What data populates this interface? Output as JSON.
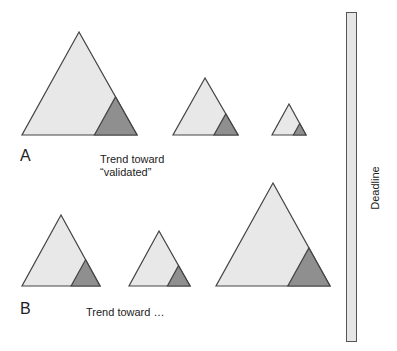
{
  "diagram": {
    "colors": {
      "light_fill": "#e8e8e8",
      "dark_fill": "#8f8f8f",
      "stroke": "#444444",
      "bar_fill": "#e6e6e6"
    },
    "row_a": {
      "label": "A",
      "caption_line1": "Trend toward",
      "caption_line2": "“validated”",
      "triangles": [
        {
          "size": "large",
          "apex": [
            79,
            32
          ],
          "base_left": 22,
          "base_right": 137,
          "base_y": 135
        },
        {
          "size": "medium",
          "apex": [
            205,
            78
          ],
          "base_left": 173,
          "base_right": 238,
          "base_y": 135
        },
        {
          "size": "small",
          "apex": [
            289,
            104
          ],
          "base_left": 272,
          "base_right": 306,
          "base_y": 135
        }
      ]
    },
    "row_b": {
      "label": "B",
      "caption": "Trend toward …",
      "triangles": [
        {
          "size": "medium",
          "apex": [
            61,
            215
          ],
          "base_left": 22,
          "base_right": 100,
          "base_y": 286
        },
        {
          "size": "small",
          "apex": [
            159,
            231
          ],
          "base_left": 129,
          "base_right": 190,
          "base_y": 286
        },
        {
          "size": "large",
          "apex": [
            273,
            183
          ],
          "base_left": 216,
          "base_right": 330,
          "base_y": 286
        }
      ]
    },
    "deadline": {
      "label": "Deadline"
    }
  }
}
